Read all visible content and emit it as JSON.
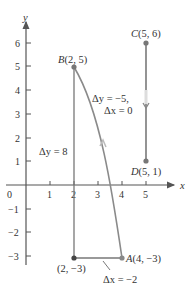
{
  "diagram": {
    "type": "coordinate-plane",
    "axes": {
      "x_label": "x",
      "y_label": "y",
      "origin_label": "0",
      "x_ticks": [
        "1",
        "2",
        "3",
        "4",
        "5"
      ],
      "y_ticks_positive": [
        "1",
        "2",
        "3",
        "4",
        "5",
        "6"
      ],
      "y_ticks_negative": [
        "−1",
        "−2",
        "−3"
      ]
    },
    "points": {
      "A": {
        "label_letter": "A",
        "label_coords": "(4, −3)",
        "x": 4,
        "y": -3
      },
      "B": {
        "label_letter": "B",
        "label_coords": "(2, 5)",
        "x": 2,
        "y": 5
      },
      "C": {
        "label_letter": "C",
        "label_coords": "(5, 6)",
        "x": 5,
        "y": 6
      },
      "D": {
        "label_letter": "D",
        "label_coords": "(5, 1)",
        "x": 5,
        "y": 1
      },
      "corner": {
        "label": "(2, −3)",
        "x": 2,
        "y": -3
      }
    },
    "annotations": {
      "delta_y_AB": "Δy = 8",
      "delta_y_CD": "Δy = −5,",
      "delta_x_CD": "Δx = 0",
      "delta_x_AB": "Δx = −2"
    },
    "colors": {
      "axis": "#555555",
      "path": "#888888",
      "point": "#777777",
      "text": "#333333"
    }
  }
}
